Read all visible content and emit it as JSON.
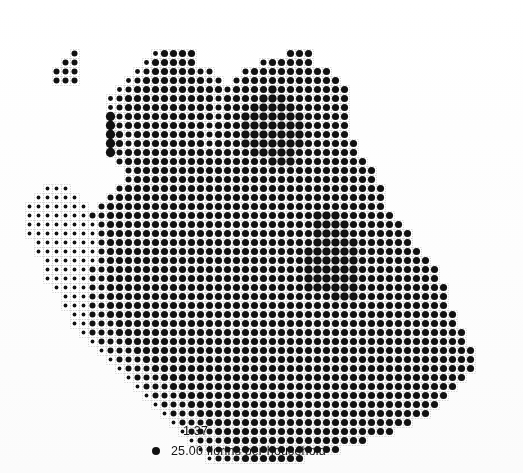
{
  "figure": {
    "type": "proportional-symbol-map",
    "background_color": "#ffffff",
    "symbol_color": "#111111",
    "grid_line_color": "#c9c9c9"
  },
  "legend": {
    "value_label": "1.37",
    "unit_label": "25.00 florins per household",
    "marker": "filled-circle",
    "marker_color": "#111111"
  },
  "chart_data": {
    "type": "heatmap",
    "title": "",
    "xlabel": "",
    "ylabel": "",
    "legend_position": "bottom",
    "grid": true,
    "encoding": "dot area proportional to value",
    "unit": "florins per household",
    "legend_reference_value": 25.0,
    "legend_small_value": 1.37,
    "value_min": 0.0,
    "value_max": 25.0,
    "cell_size_px": 9,
    "origin_x_px": 16,
    "origin_y_px": 22,
    "cols": 55,
    "rows": 49,
    "unknown_marker": "?",
    "note": "Each grid cell holds one dot whose diameter encodes the value; saturated cells merge into solid black blobs. Values are encoded per-row as run-length strings of level characters 0-9 (0 = no cell / outside map area, 1 = smallest dot, 9 = fully saturated), with '?' marking cells of unknown value.",
    "level_to_value": [
      0,
      1.37,
      3.5,
      6.0,
      8.5,
      11.5,
      14.5,
      18.0,
      21.5,
      25.0
    ],
    "rows_encoded": [
      "0000000000000000000000000000000000000000000000000000000",
      "0000000000000000000000000000000000000000000000000000000",
      "0000000000000000000000000000000000000000000000000000000",
      "0000005000000004666600000000006660000000000000000000000",
      "0000055000000046666600000005666660000000000000000000000",
      "0000555000000456666655000566666666600000000000000000000",
      "0000555000004566666665505666666666660000000000000000000",
      "0000000000045666666666656666766666666000000000000000000",
      "0000000000456666666666566667776666666000000000000000000",
      "0000000000456666666666566677777666666000000000000000000",
      "0000000000856666666666566777777766666000000000000000000",
      "0000000000856666666665666777777766666000000000000000000",
      "0000000000865666666665666777777766666000000000000000000",
      "0000000000865666666665666777777766666600000000000000000",
      "0000000000856666666666666677777666666600000000000000000",
      "0000000000056666666666666666777666666660000000000000000",
      "0000000000005666666666666666666666666666000000000000000",
      "0000000000005666666666666666666666666666000000000000000",
      "0003330000056666666666666666666666666666600000000000000",
      "0033333000566666666666666666666666666666600000000000000",
      "0333333305666666666666666666666666666666600000000000000",
      "0333333355666666666666666666666667776666660000000000000",
      "0333333335666666666666666666666667777666666000000000000",
      "0333333335666666666666666666666667777666666600000000000",
      "0033333335666666666666666666666667777766666600000000000",
      "0033333335666666666666666666666677777766666660000000000",
      "0003333335666666666666666666666677777766666666000000000",
      "0003333355666666666666666666666677777766666666600000000",
      "0003333355666666666666666666666677777766666666600000000",
      "0000333355666666666666666666666677777766666666660000000",
      "0000033355666666666666666666666666677766666666660000000",
      "0000033355666666666666666666666666666666666666660000000",
      "0000003355666666666666666666666666666666666666666000000",
      "0000003355566666666666666666666666666666666666666000000",
      "0000000355566666666666666666666666666666666666666600000",
      "0000000035556666666666666666666666666666666666666600000",
      "0000000003555666666666666666666666666666666666666660000",
      "0000000000355566666666666666666666666666666666666660000",
      "0000000000035556666666666666666666666666666666666660000",
      "0000000000003555666666666666666666666666666666666600000",
      "0000000000000355566666666666666666666666666666666000000",
      "0000000000000035556666666666666666666666666666660000000",
      "0000000000000003555666666666666666666666666666600000000",
      "0000000000000000355566666666666666666666666666000000000",
      "0000000000000000035556666666666666666666666600000000000",
      "0000000000000000003555666666666666666666660000000000000",
      "0000000000000000000355566666666666666660000000000000000",
      "0000000000000000000035556666666666660000000000000000000",
      "0000000000000000000003555666666600000000000000000000000"
    ]
  }
}
